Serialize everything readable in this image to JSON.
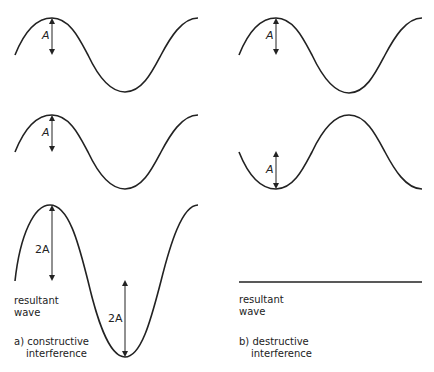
{
  "panels": {
    "a": {
      "wave1_amplitude": "A",
      "wave2_amplitude": "A",
      "result_peak_amplitude": "2A",
      "result_trough_amplitude": "2A",
      "result_label_1": "resultant",
      "result_label_2": "wave",
      "caption_1": "a) constructive",
      "caption_2": "interference"
    },
    "b": {
      "wave1_amplitude": "A",
      "wave2_amplitude": "A",
      "result_label_1": "resultant",
      "result_label_2": "wave",
      "caption_1": "b) destructive",
      "caption_2": "interference"
    }
  },
  "colors": {
    "stroke": "#222222",
    "background": "#ffffff"
  }
}
